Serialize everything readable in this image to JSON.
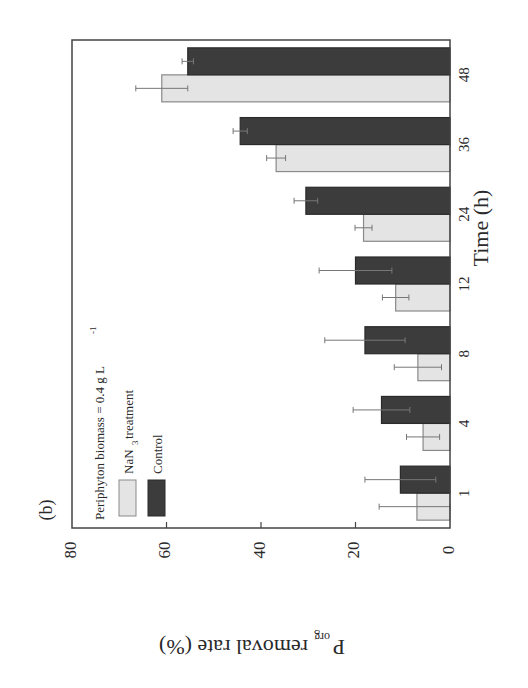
{
  "panel_label": "(b)",
  "colors": {
    "nan3": "#e4e4e4",
    "nan3_stroke": "#8a8a8a",
    "control": "#3c3c3c",
    "control_stroke": "#2a2a2a",
    "axis": "#444444",
    "errorbar": "#777777"
  },
  "chart_data": {
    "type": "bar",
    "orientation": "displayed rotated 90° counterclockwise (value axis horizontal, category axis vertical)",
    "title": "",
    "panel_label": "(b)",
    "xlabel": "Time (h)",
    "ylabel": "P_org removal rate (%)",
    "ylabel_main": "P",
    "ylabel_sub": "org",
    "ylabel_rest": " removal rate (%)",
    "categories": [
      "1",
      "4",
      "8",
      "12",
      "24",
      "36",
      "48"
    ],
    "ylim": [
      0,
      80
    ],
    "yticks": [
      0,
      20,
      40,
      60,
      80
    ],
    "grid": false,
    "legend": {
      "title": "Periphyton biomass = 0.4 g L",
      "title_superscript": "-1",
      "position": "upper-left (inside frame)",
      "entries": [
        "NaN3 treatment",
        "Control"
      ],
      "entry_main": [
        "NaN",
        "Control"
      ],
      "entry_sub": [
        "3",
        ""
      ],
      "entry_rest": [
        " treatment",
        ""
      ]
    },
    "series": [
      {
        "name": "NaN3 treatment",
        "values": [
          7,
          5.7,
          6.8,
          11.5,
          18.3,
          36.8,
          61
        ],
        "errors": [
          8,
          3.5,
          5,
          2.8,
          1.8,
          2,
          5.5
        ]
      },
      {
        "name": "Control",
        "values": [
          10.5,
          14.5,
          18,
          20,
          30.5,
          44.4,
          55.5
        ],
        "errors": [
          7.5,
          6,
          8.5,
          7.7,
          2.5,
          1.5,
          1.2
        ]
      }
    ]
  }
}
